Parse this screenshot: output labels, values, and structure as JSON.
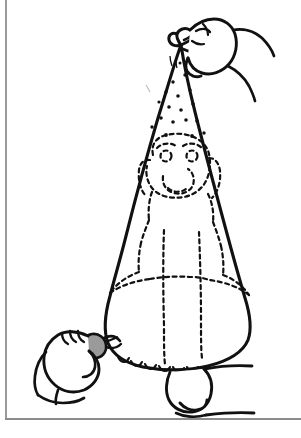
{
  "illustration": {
    "title": "Dusting a dog with flea powder inside a bag",
    "style": "black and white line drawing",
    "caption": "",
    "line_color": "#111111",
    "frame_color": "#9a9a9a",
    "background_color": "#ffffff",
    "clip_fill_color": "#9a9a9a",
    "parts": [
      {
        "name": "bag-cone",
        "label": "Bag"
      },
      {
        "name": "bag-twisted-top",
        "label": "Twisted bag top"
      },
      {
        "name": "top-hand",
        "label": "Hand gripping bag top"
      },
      {
        "name": "bottom-hand",
        "label": "Hand pinching clip"
      },
      {
        "name": "clip",
        "label": "Clip"
      },
      {
        "name": "powder-dots",
        "label": "Powder"
      },
      {
        "name": "dog-silhouette",
        "label": "Dog inside bag (dashed)"
      },
      {
        "name": "dog-paw",
        "label": "Dog paw below bag"
      },
      {
        "name": "ground-line",
        "label": "Ground line"
      }
    ],
    "powder_dot_count": 18
  },
  "frame": {
    "left_rule": "",
    "bottom_rule": ""
  }
}
